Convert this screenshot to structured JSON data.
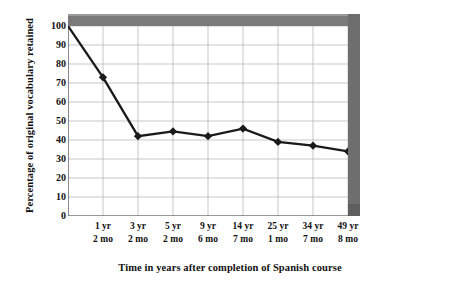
{
  "chart_data": {
    "type": "line",
    "title": "",
    "xlabel": "Time in years after completion of Spanish course",
    "ylabel": "Percentage of original vocabulary retained",
    "ylim": [
      0,
      100
    ],
    "ytick_values": [
      0,
      10,
      20,
      30,
      40,
      50,
      60,
      70,
      80,
      90,
      100
    ],
    "grid": true,
    "legend": "none",
    "categories": [
      "",
      "1 yr 2 mo",
      "3 yr 2 mo",
      "5 yr 2 mo",
      "9 yr 6 mo",
      "14 yr 7 mo",
      "25 yr 1 mo",
      "34 yr 7 mo",
      "49 yr 8 mo"
    ],
    "xtick_labels": [
      {
        "years": "1 yr",
        "months": "2 mo"
      },
      {
        "years": "3 yr",
        "months": "2 mo"
      },
      {
        "years": "5 yr",
        "months": "2 mo"
      },
      {
        "years": "9 yr",
        "months": "6 mo"
      },
      {
        "years": "14 yr",
        "months": "7 mo"
      },
      {
        "years": "25 yr",
        "months": "1 mo"
      },
      {
        "years": "34 yr",
        "months": "7 mo"
      },
      {
        "years": "49 yr",
        "months": "8 mo"
      }
    ],
    "values": [
      100,
      73,
      42,
      44.5,
      42,
      46,
      39,
      37,
      34
    ],
    "series": [
      {
        "name": "Percentage of original vocabulary retained",
        "values": [
          100,
          73,
          42,
          44.5,
          42,
          46,
          39,
          37,
          34
        ]
      }
    ],
    "line_color": "#1a1a1a",
    "marker_color": "#1a1a1a",
    "grid_color": "#b9b9b9",
    "frame_color": "#7a7a7a"
  }
}
